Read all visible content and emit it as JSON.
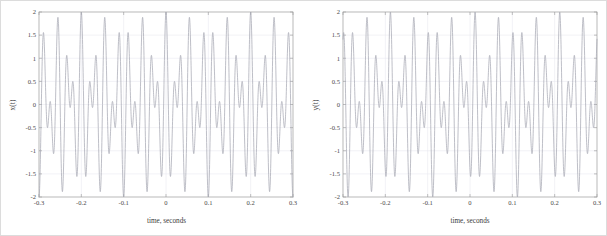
{
  "figure": {
    "background_color": "#ffffff",
    "axis_color": "#9a9a9a",
    "grid_color": "#e8e8ef",
    "line_color": "#a8aab4",
    "panel_count": 2
  },
  "chart_data": [
    {
      "type": "line",
      "panel": "left",
      "title": "",
      "xlabel": "time, seconds",
      "ylabel": "x(t)",
      "xlim": [
        -0.3,
        0.3
      ],
      "ylim": [
        -2,
        2
      ],
      "xticks": [
        -0.3,
        -0.2,
        -0.1,
        0,
        0.1,
        0.2,
        0.3
      ],
      "xticklabels": [
        "-0.3",
        "-0.2",
        "-0.1",
        "0",
        "0.1",
        "0.2",
        "0.3"
      ],
      "yticks": [
        -2,
        -1.5,
        -1,
        -0.5,
        0,
        0.5,
        1,
        1.5,
        2
      ],
      "yticklabels": [
        "-2",
        "-1.5",
        "-1",
        "-0.5",
        "0",
        "0.5",
        "1",
        "1.5",
        "2"
      ],
      "grid": true,
      "legend": null,
      "description": "Beat waveform: sum of two equal-amplitude cosines producing an amplitude-modulated envelope with maximum 2 at t = 0",
      "model": {
        "kind": "two-tone-beat",
        "amplitude_each": 1.0,
        "f1_hz": 55,
        "f2_hz": 35,
        "phase_rad": 0.0,
        "envelope_peak": 2.0,
        "envelope_period_s": 0.1,
        "carrier_freq_hz": 45,
        "beat_freq_hz": 10
      },
      "key_points": [
        {
          "x": -0.3,
          "y": 0.1
        },
        {
          "x": -0.27,
          "y": 1.62
        },
        {
          "x": -0.25,
          "y": -0.8
        },
        {
          "x": -0.228,
          "y": 0.78
        },
        {
          "x": -0.205,
          "y": -1.62
        },
        {
          "x": -0.182,
          "y": 0.12
        },
        {
          "x": -0.158,
          "y": -1.98
        },
        {
          "x": -0.137,
          "y": 0.05
        },
        {
          "x": -0.115,
          "y": -1.62
        },
        {
          "x": -0.093,
          "y": 0.79
        },
        {
          "x": -0.07,
          "y": -0.78
        },
        {
          "x": -0.046,
          "y": 1.62
        },
        {
          "x": -0.024,
          "y": -0.1
        },
        {
          "x": 0.0,
          "y": 2.0
        },
        {
          "x": 0.024,
          "y": -0.1
        },
        {
          "x": 0.046,
          "y": 1.62
        },
        {
          "x": 0.07,
          "y": -0.78
        },
        {
          "x": 0.093,
          "y": 0.79
        },
        {
          "x": 0.115,
          "y": -1.62
        },
        {
          "x": 0.137,
          "y": 0.05
        },
        {
          "x": 0.158,
          "y": -1.98
        },
        {
          "x": 0.182,
          "y": 0.12
        },
        {
          "x": 0.205,
          "y": -1.62
        },
        {
          "x": 0.228,
          "y": 0.78
        },
        {
          "x": 0.25,
          "y": -0.8
        },
        {
          "x": 0.27,
          "y": 1.62
        },
        {
          "x": 0.3,
          "y": 0.1
        }
      ]
    },
    {
      "type": "line",
      "panel": "right",
      "title": "",
      "xlabel": "time, seconds",
      "ylabel": "y(t)",
      "xlim": [
        -0.3,
        0.3
      ],
      "ylim": [
        -2,
        2
      ],
      "xticks": [
        -0.3,
        -0.2,
        -0.1,
        0,
        0.1,
        0.2,
        0.3
      ],
      "xticklabels": [
        "-0.3",
        "-0.2",
        "-0.1",
        "0",
        "0.1",
        "0.2",
        "0.3"
      ],
      "yticks": [
        -2,
        -1.5,
        -1,
        -0.5,
        0,
        0.5,
        1,
        1.5,
        2
      ],
      "yticklabels": [
        "-2",
        "-1.5",
        "-1",
        "-0.5",
        "0",
        "0.5",
        "1",
        "1.5",
        "2"
      ],
      "grid": true,
      "legend": null,
      "description": "Same two-tone beat waveform, time-shifted so the envelope maximum of 2 occurs near t = 0.012 s",
      "model": {
        "kind": "two-tone-beat",
        "amplitude_each": 1.0,
        "f1_hz": 55,
        "f2_hz": 35,
        "time_shift_s": 0.012,
        "envelope_peak": 2.0,
        "envelope_period_s": 0.1,
        "carrier_freq_hz": 45,
        "beat_freq_hz": 10
      },
      "key_points": [
        {
          "x": -0.3,
          "y": 1.95
        },
        {
          "x": -0.288,
          "y": -0.05
        },
        {
          "x": -0.262,
          "y": 1.68
        },
        {
          "x": -0.24,
          "y": -0.7
        },
        {
          "x": -0.218,
          "y": 0.88
        },
        {
          "x": -0.196,
          "y": -1.55
        },
        {
          "x": -0.172,
          "y": 0.15
        },
        {
          "x": -0.148,
          "y": -1.97
        },
        {
          "x": -0.126,
          "y": 0.02
        },
        {
          "x": -0.104,
          "y": -1.7
        },
        {
          "x": -0.082,
          "y": 0.68
        },
        {
          "x": -0.06,
          "y": -0.88
        },
        {
          "x": -0.034,
          "y": 1.56
        },
        {
          "x": -0.012,
          "y": -0.14
        },
        {
          "x": 0.012,
          "y": 2.0
        },
        {
          "x": 0.034,
          "y": -0.05
        },
        {
          "x": 0.056,
          "y": 1.68
        },
        {
          "x": 0.078,
          "y": -0.7
        },
        {
          "x": 0.1,
          "y": 0.88
        },
        {
          "x": 0.122,
          "y": -1.55
        },
        {
          "x": 0.146,
          "y": 0.15
        },
        {
          "x": 0.17,
          "y": -1.97
        },
        {
          "x": 0.192,
          "y": 0.02
        },
        {
          "x": 0.214,
          "y": -1.7
        },
        {
          "x": 0.236,
          "y": 0.68
        },
        {
          "x": 0.258,
          "y": -0.88
        },
        {
          "x": 0.282,
          "y": 1.56
        },
        {
          "x": 0.3,
          "y": 0.02
        }
      ]
    }
  ]
}
